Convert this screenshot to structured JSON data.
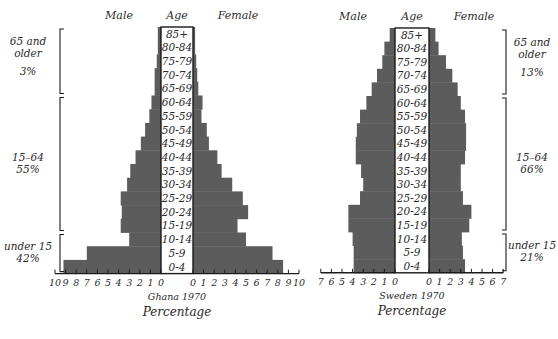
{
  "chart_data": [
    {
      "type": "bar",
      "subtype": "population-pyramid",
      "title": "Ghana 1970",
      "xlabel": "Percentage",
      "header_left": "Male",
      "header_center": "Age",
      "header_right": "Female",
      "categories": [
        "85+",
        "80-84",
        "75-79",
        "70-74",
        "65-69",
        "60-64",
        "55-59",
        "50-54",
        "45-49",
        "40-44",
        "35-39",
        "30-34",
        "25-29",
        "20-24",
        "15-19",
        "10-14",
        "5-9",
        "0-4"
      ],
      "series": [
        {
          "name": "Male",
          "values": [
            0.3,
            0.3,
            0.4,
            0.6,
            0.6,
            0.9,
            1.1,
            1.5,
            1.9,
            2.4,
            2.9,
            3.2,
            3.8,
            3.7,
            3.8,
            3.0,
            7.0,
            9.2
          ]
        },
        {
          "name": "Female",
          "values": [
            0.2,
            0.2,
            0.3,
            0.4,
            0.5,
            0.9,
            0.8,
            1.3,
            1.5,
            2.3,
            2.7,
            3.7,
            4.7,
            5.2,
            4.2,
            5.0,
            7.5,
            8.5
          ]
        }
      ],
      "male_ticks": [
        "10",
        "9",
        "8",
        "7",
        "6",
        "5",
        "4",
        "3",
        "2",
        "1",
        "0"
      ],
      "female_ticks": [
        "0",
        "1",
        "2",
        "3",
        "4",
        "5",
        "6",
        "7",
        "8",
        "9",
        "10"
      ],
      "xlim_male": [
        0,
        10
      ],
      "xlim_female": [
        0,
        10
      ],
      "bracket_side": "left",
      "groups": [
        {
          "label_lines": [
            "65 and",
            "older"
          ],
          "pct": "3%",
          "from": "85+",
          "to": "65-69"
        },
        {
          "label_lines": [
            "15–64"
          ],
          "pct": "55%",
          "from": "60-64",
          "to": "15-19"
        },
        {
          "label_lines": [
            "under 15"
          ],
          "pct": "42%",
          "from": "10-14",
          "to": "0-4"
        }
      ]
    },
    {
      "type": "bar",
      "subtype": "population-pyramid",
      "title": "Sweden 1970",
      "xlabel": "Percentage",
      "header_left": "Male",
      "header_center": "Age",
      "header_right": "Female",
      "categories": [
        "85+",
        "80-84",
        "75-79",
        "70-74",
        "65-69",
        "60-64",
        "55-59",
        "50-54",
        "45-49",
        "40-44",
        "35-39",
        "30-34",
        "25-29",
        "20-24",
        "15-19",
        "10-14",
        "5-9",
        "0-4"
      ],
      "series": [
        {
          "name": "Male",
          "values": [
            0.5,
            1.0,
            1.2,
            1.7,
            2.2,
            2.7,
            3.3,
            3.6,
            3.7,
            3.7,
            3.2,
            3.0,
            3.3,
            4.4,
            4.4,
            4.0,
            3.9,
            3.9
          ]
        },
        {
          "name": "Female",
          "values": [
            0.6,
            0.9,
            1.6,
            2.2,
            2.7,
            3.0,
            3.4,
            3.5,
            3.5,
            3.4,
            3.0,
            3.0,
            3.2,
            4.0,
            3.8,
            3.1,
            3.2,
            3.4
          ]
        }
      ],
      "male_ticks": [
        "7",
        "6",
        "5",
        "4",
        "3",
        "2",
        "1",
        "0"
      ],
      "female_ticks": [
        "0",
        "1",
        "2",
        "3",
        "4",
        "5",
        "6",
        "7"
      ],
      "xlim_male": [
        0,
        7
      ],
      "xlim_female": [
        0,
        7
      ],
      "bracket_side": "right",
      "groups": [
        {
          "label_lines": [
            "65 and",
            "older"
          ],
          "pct": "13%",
          "from": "85+",
          "to": "65-69"
        },
        {
          "label_lines": [
            "15–64"
          ],
          "pct": "66%",
          "from": "60-64",
          "to": "15-19"
        },
        {
          "label_lines": [
            "under 15"
          ],
          "pct": "21%",
          "from": "10-14",
          "to": "0-4"
        }
      ]
    }
  ],
  "colors": {
    "bar": "#5c5c5c",
    "text": "#2a2a2a",
    "axis": "#1a1a1a",
    "age_box": "#ffffff"
  }
}
